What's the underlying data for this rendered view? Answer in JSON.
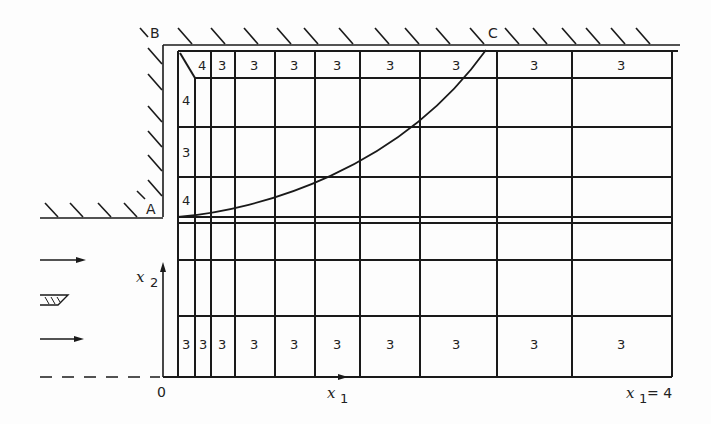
{
  "diagram": {
    "type": "computational-grid-flow-domain",
    "corner_labels": {
      "A": "A",
      "B": "B",
      "C": "C"
    },
    "origin_label": "0",
    "axis_x1_label": "x",
    "axis_x1_sub": "1",
    "axis_x2_label": "x",
    "axis_x2_sub": "2",
    "x1_end_label": "x",
    "x1_end_sub": "1",
    "x1_end_value": "= 4",
    "top_row_cell_values": [
      "4",
      "3",
      "3",
      "3",
      "3",
      "3",
      "3",
      "3",
      "3"
    ],
    "left_column_cell_values": [
      "4",
      "3",
      "4"
    ],
    "bottom_row_cell_values": [
      "3",
      "3",
      "3",
      "3",
      "3",
      "3",
      "3",
      "3",
      "3",
      "3"
    ],
    "column_lines_x": [
      178,
      195,
      211,
      235,
      275,
      315,
      360,
      420,
      497,
      572,
      672
    ],
    "row_lines_y": [
      51,
      78,
      127,
      177,
      217,
      223,
      260,
      316,
      377
    ],
    "colors": {
      "ink": "#1a1a1a",
      "background": "#fdfdfd"
    }
  }
}
